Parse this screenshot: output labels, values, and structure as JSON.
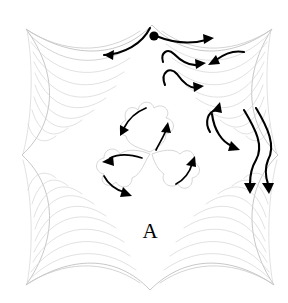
{
  "figure": {
    "label": "A",
    "label_x": 150,
    "label_y": 238,
    "type": "quilting-stitch-direction-diagram",
    "width": 288,
    "height": 303
  },
  "colors": {
    "background": "#ffffff",
    "block_outline": "#b9b9b9",
    "feather_line": "#c6c6c6",
    "feather_line_faint": "#d4d4d4",
    "motif_outline": "#cccccc",
    "stitch_arrow": "#000000"
  },
  "block": {
    "name": "cusped-square-block",
    "corners": [
      {
        "name": "top-left",
        "x": 26,
        "y": 29
      },
      {
        "name": "top-right",
        "x": 272,
        "y": 29
      },
      {
        "name": "bottom-right",
        "x": 274,
        "y": 285
      },
      {
        "name": "bottom-left",
        "x": 26,
        "y": 285
      }
    ],
    "edge_cusps": [
      {
        "name": "top-center-cusp",
        "x": 152,
        "y": 25
      },
      {
        "name": "right-center-cusp",
        "x": 278,
        "y": 155
      },
      {
        "name": "bottom-center-cusp",
        "x": 150,
        "y": 290
      },
      {
        "name": "left-center-cusp",
        "x": 22,
        "y": 155
      }
    ]
  },
  "corner_motifs": [
    {
      "name": "feather-plume-top-left",
      "plume_count": 7,
      "origin_corner": "top-left"
    },
    {
      "name": "feather-plume-top-right",
      "plume_count": 7,
      "origin_corner": "top-right"
    },
    {
      "name": "feather-plume-bottom-left",
      "plume_count": 7,
      "origin_corner": "bottom-left"
    },
    {
      "name": "feather-plume-bottom-right",
      "plume_count": 7,
      "origin_corner": "bottom-right"
    }
  ],
  "center_motif": {
    "name": "trefoil-clover",
    "leaf_count": 3,
    "center_x": 150,
    "center_y": 152,
    "leaves": [
      {
        "name": "top-leaf",
        "cx": 150,
        "cy": 127
      },
      {
        "name": "bottom-left-leaf",
        "cx": 128,
        "cy": 175
      },
      {
        "name": "bottom-right-leaf",
        "cx": 174,
        "cy": 175
      }
    ]
  },
  "start_marker": {
    "name": "stitch-start-dot",
    "x": 154,
    "y": 36,
    "radius": 4.5
  },
  "stitch_arrows": [
    {
      "name": "arrow-top-inflow-left",
      "direction": "left",
      "region": "top-center",
      "note": "long curve flowing left into top cusp"
    },
    {
      "name": "arrow-top-right-1",
      "direction": "right",
      "region": "top-right",
      "note": "upper spine arrow from start dot"
    },
    {
      "name": "arrow-top-right-2",
      "direction": "right",
      "region": "top-right",
      "note": "middle plume arrow"
    },
    {
      "name": "arrow-top-right-3",
      "direction": "right",
      "region": "top-right",
      "note": "lower plume arrow"
    },
    {
      "name": "arrow-top-right-return",
      "direction": "left",
      "region": "top-right",
      "note": "return stroke pointing back left"
    },
    {
      "name": "arrow-right-up",
      "direction": "up",
      "region": "right-middle",
      "note": "plume arrow pointing upward"
    },
    {
      "name": "arrow-right-down-right",
      "direction": "down-right",
      "region": "right-middle",
      "note": "plume arrow angled down-right"
    },
    {
      "name": "arrow-right-down-1",
      "direction": "down",
      "region": "right-cusp",
      "note": "descending stroke through right cusp"
    },
    {
      "name": "arrow-right-down-2",
      "direction": "down",
      "region": "right-cusp",
      "note": "second descending stroke through right cusp"
    },
    {
      "name": "arrow-trefoil-top",
      "direction": "down-left",
      "region": "center-top-leaf"
    },
    {
      "name": "arrow-trefoil-left",
      "direction": "left",
      "region": "center-left-leaf"
    },
    {
      "name": "arrow-trefoil-left-bottom",
      "direction": "down-right",
      "region": "center-left-leaf"
    },
    {
      "name": "arrow-trefoil-right",
      "direction": "up-right",
      "region": "center-right-leaf"
    },
    {
      "name": "arrow-trefoil-inner-right",
      "direction": "up-right",
      "region": "center-inner"
    }
  ]
}
